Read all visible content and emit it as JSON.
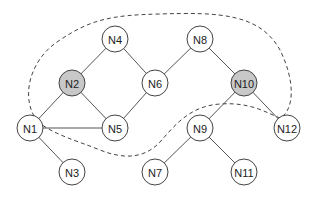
{
  "diagram": {
    "type": "graph",
    "node_radius": 13,
    "colors": {
      "highlight_fill": "#c8c8c8",
      "normal_fill": "#ffffff",
      "stroke": "#444444"
    },
    "nodes": [
      {
        "id": "N1",
        "label": "N1",
        "x": 30,
        "y": 128,
        "highlighted": false
      },
      {
        "id": "N2",
        "label": "N2",
        "x": 72,
        "y": 83,
        "highlighted": true
      },
      {
        "id": "N3",
        "label": "N3",
        "x": 72,
        "y": 172,
        "highlighted": false
      },
      {
        "id": "N4",
        "label": "N4",
        "x": 115,
        "y": 39,
        "highlighted": false
      },
      {
        "id": "N5",
        "label": "N5",
        "x": 115,
        "y": 128,
        "highlighted": false
      },
      {
        "id": "N6",
        "label": "N6",
        "x": 155,
        "y": 83,
        "highlighted": false
      },
      {
        "id": "N7",
        "label": "N7",
        "x": 155,
        "y": 172,
        "highlighted": false
      },
      {
        "id": "N8",
        "label": "N8",
        "x": 200,
        "y": 39,
        "highlighted": false
      },
      {
        "id": "N9",
        "label": "N9",
        "x": 200,
        "y": 128,
        "highlighted": false
      },
      {
        "id": "N10",
        "label": "N10",
        "x": 244,
        "y": 83,
        "highlighted": true
      },
      {
        "id": "N11",
        "label": "N11",
        "x": 244,
        "y": 172,
        "highlighted": false
      },
      {
        "id": "N12",
        "label": "N12",
        "x": 287,
        "y": 128,
        "highlighted": false
      }
    ],
    "edges": [
      [
        "N4",
        "N2"
      ],
      [
        "N4",
        "N6"
      ],
      [
        "N2",
        "N5"
      ],
      [
        "N2",
        "N1"
      ],
      [
        "N6",
        "N5"
      ],
      [
        "N6",
        "N8"
      ],
      [
        "N8",
        "N10"
      ],
      [
        "N10",
        "N9"
      ],
      [
        "N10",
        "N12"
      ],
      [
        "N1",
        "N5"
      ],
      [
        "N1",
        "N3"
      ],
      [
        "N9",
        "N7"
      ],
      [
        "N9",
        "N11"
      ]
    ],
    "region": {
      "style": "dashed",
      "encloses": [
        "N2",
        "N4",
        "N5",
        "N6",
        "N8",
        "N10"
      ]
    }
  }
}
